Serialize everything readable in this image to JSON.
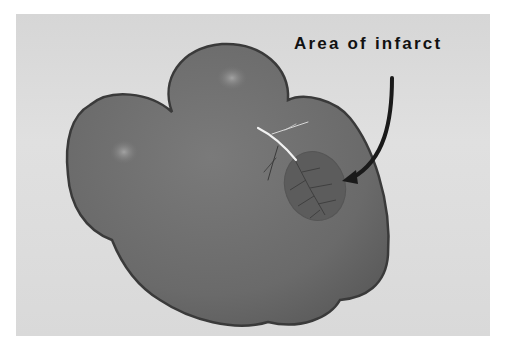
{
  "figure": {
    "annotation": {
      "label": "Area of infarct",
      "pointer": "curved-arrow"
    },
    "colors": {
      "background": "#ffffff",
      "board": "#dcdcdc",
      "heart_fill": "#6e6e6e",
      "heart_outline": "#3a3a3a",
      "infarct_fill": "#5a5a5a",
      "artery": "#f0f0f0",
      "arrow": "#1a1a1a",
      "label_text": "#111111"
    }
  }
}
